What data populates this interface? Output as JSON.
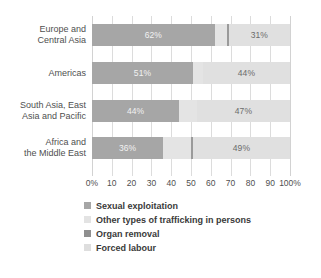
{
  "chart_data": {
    "type": "bar",
    "orientation": "horizontal",
    "stacked": true,
    "title": "",
    "subtitle": "",
    "xlabel": "",
    "ylabel": "",
    "xlim": [
      0,
      100
    ],
    "grid": true,
    "legend_position": "bottom-left",
    "categories": [
      "Europe and Central Asia",
      "Americas",
      "South Asia, East Asia and Pacific",
      "Africa and the Middle East"
    ],
    "category_lines": [
      [
        "Europe and",
        "Central Asia"
      ],
      [
        "Americas"
      ],
      [
        "South Asia, East",
        "Asia and Pacific"
      ],
      [
        "Africa and",
        "the Middle East"
      ]
    ],
    "series": [
      {
        "name": "Sexual exploitation",
        "color": "#a6a6a6",
        "values": [
          62,
          51,
          44,
          36
        ],
        "labels": [
          "62%",
          "51%",
          "44%",
          "36%"
        ]
      },
      {
        "name": "Forced labour",
        "color": "#e4e4e4",
        "values": [
          6,
          5,
          9,
          14
        ],
        "labels": [
          "",
          "",
          "",
          ""
        ]
      },
      {
        "name": "Organ removal",
        "color": "#9a9a9a",
        "values": [
          1,
          0,
          0,
          1
        ],
        "labels": [
          "",
          "",
          "",
          ""
        ]
      },
      {
        "name": "Other types of trafficking in persons",
        "color": "#e0e0e0",
        "values": [
          31,
          44,
          47,
          49
        ],
        "labels": [
          "31%",
          "44%",
          "47%",
          "49%"
        ]
      }
    ],
    "xticks": [
      {
        "value": 0,
        "label": "0%"
      },
      {
        "value": 10,
        "label": "10"
      },
      {
        "value": 20,
        "label": "20"
      },
      {
        "value": 30,
        "label": "30"
      },
      {
        "value": 40,
        "label": "40"
      },
      {
        "value": 50,
        "label": "50"
      },
      {
        "value": 60,
        "label": "60"
      },
      {
        "value": 70,
        "label": "70"
      },
      {
        "value": 80,
        "label": "80"
      },
      {
        "value": 90,
        "label": "90"
      },
      {
        "value": 100,
        "label": "100%"
      }
    ],
    "legend": [
      {
        "label": "Sexual exploitation",
        "color": "#a6a6a6"
      },
      {
        "label": "Other types of trafficking in persons",
        "color": "#e3e3e3"
      },
      {
        "label": "Organ removal",
        "color": "#8f8f8f"
      },
      {
        "label": "Forced labour",
        "color": "#dedede"
      }
    ]
  }
}
